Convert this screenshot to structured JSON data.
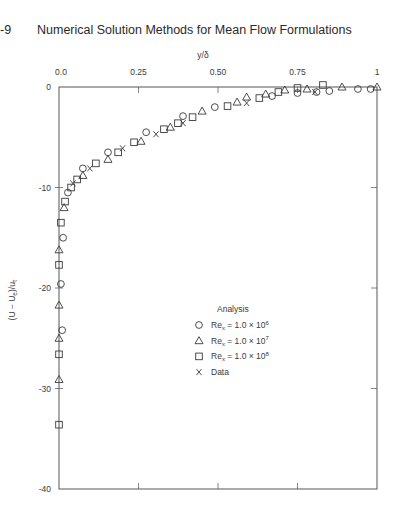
{
  "header": {
    "page_number": "-9",
    "title": "Numerical Solution Methods for Mean Flow Formulations"
  },
  "chart_data": {
    "type": "scatter",
    "title": "",
    "xlabel": "y/δ",
    "ylabel": {
      "main": "(U − U",
      "sub1": "e",
      "mid": ")/u",
      "sub2": "τ"
    },
    "xlim": [
      0,
      1
    ],
    "ylim": [
      -40,
      0
    ],
    "x_axis_position": "top",
    "grid": false,
    "x_ticks": [
      {
        "value": 0.0,
        "label": "0.0"
      },
      {
        "value": 0.25,
        "label": "0.25"
      },
      {
        "value": 0.5,
        "label": "0.50"
      },
      {
        "value": 0.75,
        "label": "0.75"
      },
      {
        "value": 1.0,
        "label": "1"
      }
    ],
    "y_ticks": [
      {
        "value": 0,
        "label": "0"
      },
      {
        "value": -10,
        "label": "-10"
      },
      {
        "value": -20,
        "label": "-20"
      },
      {
        "value": -30,
        "label": "-30"
      },
      {
        "value": -40,
        "label": "-40"
      }
    ],
    "legend": {
      "title": "Analysis",
      "position": "inside, right-center",
      "entries": [
        {
          "marker": "circle",
          "main": "Re",
          "sub": "x",
          "rest": " = 1.0 × 10",
          "sup": "6"
        },
        {
          "marker": "triangle",
          "main": "Re",
          "sub": "x",
          "rest": " = 1.0 × 10",
          "sup": "7"
        },
        {
          "marker": "square",
          "main": "Re",
          "sub": "x",
          "rest": " = 1.0 × 10",
          "sup": "8"
        },
        {
          "marker": "x",
          "main": "Data",
          "sub": "",
          "rest": "",
          "sup": ""
        }
      ]
    },
    "series": [
      {
        "name": "Re_x = 1.0 × 10^6 (Analysis)",
        "marker": "circle",
        "x": [
          0.01,
          0.006,
          0.013,
          0.028,
          0.075,
          0.154,
          0.274,
          0.39,
          0.49,
          0.67,
          0.75,
          0.81,
          0.85,
          0.94,
          0.98
        ],
        "y": [
          -24.2,
          -19.6,
          -15.0,
          -10.5,
          -8.1,
          -6.5,
          -4.5,
          -2.9,
          -2.0,
          -0.9,
          -0.6,
          -0.5,
          -0.4,
          -0.2,
          -0.2
        ]
      },
      {
        "name": "Re_x = 1.0 × 10^7 (Analysis)",
        "marker": "triangle",
        "x": [
          0.0,
          0.0,
          0.0,
          0.0,
          0.016,
          0.075,
          0.154,
          0.258,
          0.35,
          0.45,
          0.56,
          0.59,
          0.65,
          0.71,
          0.78,
          0.89,
          1.0
        ],
        "y": [
          -29.1,
          -25.0,
          -21.7,
          -16.2,
          -12.0,
          -8.8,
          -7.2,
          -5.4,
          -4.0,
          -2.4,
          -1.5,
          -1.0,
          -0.7,
          -0.3,
          -0.2,
          0.0,
          0.0
        ]
      },
      {
        "name": "Re_x = 1.0 × 10^8 (Analysis)",
        "marker": "square",
        "x": [
          0.0,
          0.0,
          0.0,
          0.006,
          0.019,
          0.038,
          0.057,
          0.116,
          0.186,
          0.236,
          0.33,
          0.374,
          0.42,
          0.53,
          0.63,
          0.69,
          0.75,
          0.83
        ],
        "y": [
          -33.6,
          -26.6,
          -17.7,
          -13.5,
          -11.4,
          -10.0,
          -9.2,
          -7.6,
          -6.5,
          -5.5,
          -4.2,
          -3.6,
          -3.0,
          -1.9,
          -1.1,
          -0.5,
          -0.1,
          0.2
        ]
      },
      {
        "name": "Data",
        "marker": "x",
        "x": [
          0.044,
          0.097,
          0.2,
          0.305,
          0.39,
          0.59,
          0.805
        ],
        "y": [
          -9.6,
          -8.1,
          -6.1,
          -4.7,
          -3.6,
          -1.6,
          -0.5
        ]
      }
    ]
  }
}
